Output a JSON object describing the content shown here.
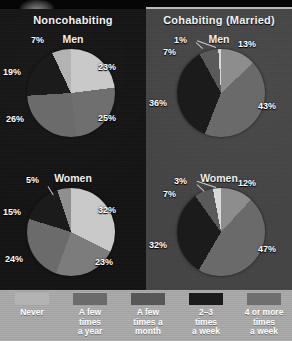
{
  "figure": {
    "panels": [
      {
        "title": "Noncohabiting",
        "groups": [
          "Men",
          "Women"
        ]
      },
      {
        "title": "Cohabiting (Married)",
        "groups": [
          "Men",
          "Women"
        ]
      }
    ],
    "legend": {
      "items": [
        {
          "label": "Never",
          "color": "#b3b3b3"
        },
        {
          "label": "A few\ntimes\na year",
          "color": "#6b6b6b"
        },
        {
          "label": "A few\ntimes a\nmonth",
          "color": "#575757"
        },
        {
          "label": "2–3\ntimes\na week",
          "color": "#1b1b1b"
        },
        {
          "label": "4 or more\ntimes\na week",
          "color": "#6f6f6f"
        }
      ]
    },
    "panel_bg": {
      "left": "#121212",
      "right": "#434343"
    }
  },
  "chart_data": [
    {
      "type": "pie",
      "title": "Noncohabiting — Men",
      "panel": "Noncohabiting",
      "group": "Men",
      "categories": [
        "Never",
        "A few times a year",
        "A few times a month",
        "2–3 times a week",
        "4 or more times a week"
      ],
      "values": [
        7,
        23,
        25,
        26,
        19
      ],
      "labels": [
        "7%",
        "23%",
        "25%",
        "26%",
        "19%"
      ],
      "colors": [
        "#b3b3b3",
        "#c9c9c9",
        "#6f6f6f",
        "#6b6b6b",
        "#1b1b1b"
      ],
      "legend_position": "bottom"
    },
    {
      "type": "pie",
      "title": "Noncohabiting — Women",
      "panel": "Noncohabiting",
      "group": "Women",
      "categories": [
        "Never",
        "A few times a year",
        "A few times a month",
        "2–3 times a week",
        "4 or more times a week"
      ],
      "values": [
        5,
        32,
        23,
        24,
        15
      ],
      "labels": [
        "5%",
        "32%",
        "23%",
        "24%",
        "15%"
      ],
      "colors": [
        "#8f8f8f",
        "#c9c9c9",
        "#7c7c7c",
        "#6b6b6b",
        "#1b1b1b"
      ],
      "legend_position": "bottom"
    },
    {
      "type": "pie",
      "title": "Cohabiting (Married) — Men",
      "panel": "Cohabiting (Married)",
      "group": "Men",
      "categories": [
        "Never",
        "A few times a year",
        "A few times a month",
        "2–3 times a week",
        "4 or more times a week"
      ],
      "values": [
        1,
        13,
        43,
        36,
        7
      ],
      "labels": [
        "1%",
        "13%",
        "43%",
        "36%",
        "7%"
      ],
      "colors": [
        "#d8d8d8",
        "#8d8d8d",
        "#6a6a6a",
        "#1b1b1b",
        "#5a5a5a"
      ],
      "legend_position": "bottom"
    },
    {
      "type": "pie",
      "title": "Cohabiting (Married) — Women",
      "panel": "Cohabiting (Married)",
      "group": "Women",
      "categories": [
        "Never",
        "A few times a year",
        "A few times a month",
        "2–3 times a week",
        "4 or more times a week"
      ],
      "values": [
        3,
        12,
        47,
        32,
        7
      ],
      "labels": [
        "3%",
        "12%",
        "47%",
        "32%",
        "7%"
      ],
      "colors": [
        "#d8d8d8",
        "#8d8d8d",
        "#6a6a6a",
        "#1b1b1b",
        "#5a5a5a"
      ],
      "legend_position": "bottom"
    }
  ]
}
